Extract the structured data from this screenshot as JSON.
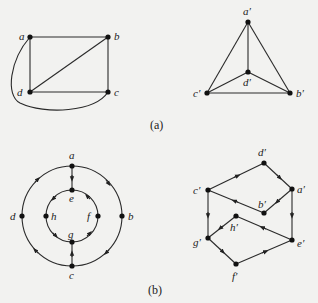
{
  "figure": {
    "panel_a": {
      "caption": "(a)",
      "graph_left": {
        "nodes": [
          {
            "id": "a",
            "label": "a",
            "x": 30,
            "y": 37
          },
          {
            "id": "b",
            "label": "b",
            "x": 108,
            "y": 37
          },
          {
            "id": "c",
            "label": "c",
            "x": 108,
            "y": 92
          },
          {
            "id": "d",
            "label": "d",
            "x": 30,
            "y": 92
          }
        ],
        "edges": [
          [
            "a",
            "b"
          ],
          [
            "b",
            "c"
          ],
          [
            "c",
            "d"
          ],
          [
            "d",
            "a"
          ],
          [
            "d",
            "b"
          ],
          [
            "a",
            "c",
            "curved"
          ]
        ]
      },
      "graph_right": {
        "nodes": [
          {
            "id": "a'",
            "label": "a′",
            "x": 248,
            "y": 22
          },
          {
            "id": "b'",
            "label": "b′",
            "x": 290,
            "y": 93
          },
          {
            "id": "c'",
            "label": "c′",
            "x": 207,
            "y": 93
          },
          {
            "id": "d'",
            "label": "d′",
            "x": 248,
            "y": 72
          }
        ],
        "edges": [
          [
            "a'",
            "b'"
          ],
          [
            "a'",
            "c'"
          ],
          [
            "a'",
            "d'"
          ],
          [
            "b'",
            "c'"
          ],
          [
            "c'",
            "d'"
          ],
          [
            "d'",
            "b'"
          ]
        ]
      }
    },
    "panel_b": {
      "caption": "(b)",
      "graph_left": {
        "nodes": [
          {
            "id": "a",
            "label": "a"
          },
          {
            "id": "b",
            "label": "b"
          },
          {
            "id": "c",
            "label": "c"
          },
          {
            "id": "d",
            "label": "d"
          },
          {
            "id": "e",
            "label": "e"
          },
          {
            "id": "f",
            "label": "f"
          },
          {
            "id": "g",
            "label": "g"
          },
          {
            "id": "h",
            "label": "h"
          }
        ],
        "directed_edges": [
          [
            "a",
            "e"
          ],
          [
            "c",
            "g"
          ],
          [
            "a",
            "b"
          ],
          [
            "b",
            "c"
          ],
          [
            "c",
            "d"
          ],
          [
            "d",
            "a"
          ],
          [
            "g",
            "f"
          ],
          [
            "f",
            "e"
          ],
          [
            "e",
            "h"
          ],
          [
            "h",
            "g"
          ]
        ]
      },
      "graph_right": {
        "nodes": [
          {
            "id": "a'",
            "label": "a′"
          },
          {
            "id": "b'",
            "label": "b′"
          },
          {
            "id": "c'",
            "label": "c′"
          },
          {
            "id": "d'",
            "label": "d′"
          },
          {
            "id": "e'",
            "label": "e′"
          },
          {
            "id": "f'",
            "label": "f′"
          },
          {
            "id": "g'",
            "label": "g′"
          },
          {
            "id": "h'",
            "label": "h′"
          }
        ],
        "directed_edges": [
          [
            "c'",
            "d'"
          ],
          [
            "d'",
            "a'"
          ],
          [
            "a'",
            "b'"
          ],
          [
            "b'",
            "c'"
          ],
          [
            "c'",
            "g'"
          ],
          [
            "a'",
            "e'"
          ],
          [
            "e'",
            "h'"
          ],
          [
            "h'",
            "g'"
          ],
          [
            "g'",
            "f'"
          ],
          [
            "f'",
            "e'"
          ]
        ]
      }
    }
  }
}
